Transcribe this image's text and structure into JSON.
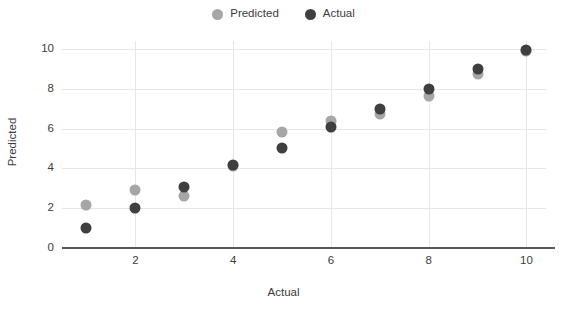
{
  "chart_data": {
    "type": "scatter",
    "title": "",
    "xlabel": "Actual",
    "ylabel": "Predicted",
    "xlim": [
      0.5,
      10.4
    ],
    "ylim": [
      0,
      10.4
    ],
    "grid": true,
    "legend_position": "top-center",
    "x": [
      1,
      2,
      3,
      4,
      5,
      6,
      7,
      8,
      9,
      10
    ],
    "series": [
      {
        "name": "Predicted",
        "color": "#a6a6a6",
        "values": [
          2.15,
          2.9,
          2.6,
          4.1,
          5.85,
          6.4,
          6.75,
          7.65,
          8.75,
          9.9
        ]
      },
      {
        "name": "Actual",
        "color": "#3f3f3f",
        "values": [
          1.0,
          2.0,
          3.05,
          4.15,
          5.0,
          6.1,
          7.0,
          8.0,
          9.0,
          9.95
        ]
      }
    ],
    "xticks": [
      2,
      4,
      6,
      8,
      10
    ],
    "yticks": [
      0,
      2,
      4,
      6,
      8,
      10
    ],
    "xtick_labels": [
      "2",
      "4",
      "6",
      "8",
      "10"
    ],
    "ytick_labels": [
      "0",
      "2",
      "4",
      "6",
      "8",
      "10"
    ]
  },
  "legend": {
    "entries": [
      {
        "label": "Predicted",
        "color": "#a6a6a6"
      },
      {
        "label": "Actual",
        "color": "#3f3f3f"
      }
    ]
  },
  "axes": {
    "x_title": "Actual",
    "y_title": "Predicted"
  },
  "colors": {
    "background": "#ffffff",
    "gridline": "#e7e7e7",
    "axis": "#585858",
    "text": "#3c3c3c",
    "predicted": "#a6a6a6",
    "actual": "#3f3f3f"
  }
}
